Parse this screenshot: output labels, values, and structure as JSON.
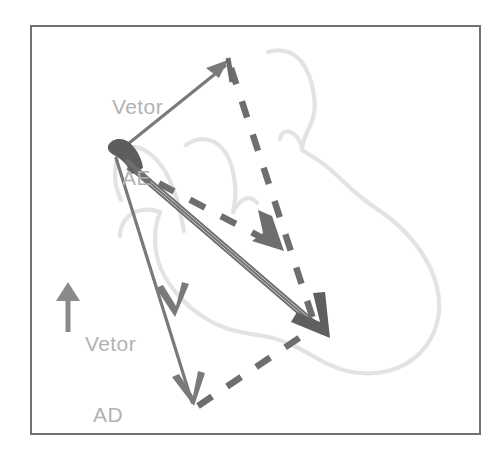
{
  "figure": {
    "background_color": "#ffffff",
    "frame": {
      "name": "figure-border",
      "x": 30,
      "y": 25,
      "width": 450,
      "height": 409,
      "stroke": "#6f7277",
      "stroke_width": 2
    },
    "labels": [
      {
        "id": "vetor-ae",
        "line1": "Vetor",
        "line2": "AE",
        "color": "#b2b2b2",
        "x": 112,
        "y": 48
      },
      {
        "id": "vetor-ad",
        "line1": "Vetor",
        "line2": "AD",
        "color": "#b2b2b2",
        "x": 85,
        "y": 285
      }
    ],
    "icons": [
      {
        "id": "up-arrow-icon",
        "name": "up-arrow-icon",
        "color": "#8a8a8a",
        "x": 67,
        "y": 283,
        "length": 48
      }
    ],
    "colors": {
      "frame_stroke": "#6f7277",
      "solid_vector": "#787878",
      "dark_arrowhead": "#5f5f5f",
      "dashed_vector": "#6e6e6e",
      "sketch_outline": "#e2e2e2",
      "label_text": "#b2b2b2",
      "page_background": "#ffffff"
    },
    "points": {
      "A": {
        "label": "A",
        "x": 113,
        "y": 150
      },
      "E": {
        "label": "E",
        "x": 226,
        "y": 62
      },
      "D": {
        "label": "D",
        "x": 192,
        "y": 400
      },
      "M": {
        "label": "M",
        "x": 278,
        "y": 248
      },
      "R": {
        "label": "R",
        "x": 315,
        "y": 326
      }
    },
    "vectors": [
      {
        "id": "vector-ae",
        "name": "vector-ae-solid-arrow",
        "style": "solid",
        "from": "A",
        "to": "E",
        "color": "#787878",
        "width": 3,
        "arrowhead": "single"
      },
      {
        "id": "vector-ad",
        "name": "vector-ad-solid-arrow",
        "style": "solid",
        "from": "A",
        "to": "D",
        "color": "#787878",
        "width": 3,
        "arrowhead": "double"
      },
      {
        "id": "vector-resultant",
        "name": "vector-resultant-solid-arrow",
        "style": "solid-triple",
        "from": "A",
        "to": "R",
        "color": "#5f5f5f",
        "width": 2,
        "arrowhead": "single-large"
      },
      {
        "id": "vector-mid-dashed",
        "name": "vector-mid-dashed-arrow",
        "style": "dashed",
        "from": "A",
        "to": "M",
        "color": "#6e6e6e",
        "width": 6,
        "arrowhead": "single"
      },
      {
        "id": "vector-e-to-r-dashed",
        "name": "vector-e-to-r-dashed",
        "style": "dashed",
        "from": "E",
        "to": "R",
        "color": "#6e6e6e",
        "width": 6,
        "arrowhead": "none"
      },
      {
        "id": "vector-d-to-r-dashed",
        "name": "vector-d-to-r-dashed",
        "style": "dashed",
        "from": "D",
        "to": "R",
        "color": "#6e6e6e",
        "width": 6,
        "arrowhead": "none"
      }
    ],
    "sketch": {
      "name": "anatomical-outline-sketch",
      "color": "#e2e2e2",
      "stroke_width": 4,
      "description": "faint hand-drawn organ outline behind the vector diagram"
    }
  }
}
